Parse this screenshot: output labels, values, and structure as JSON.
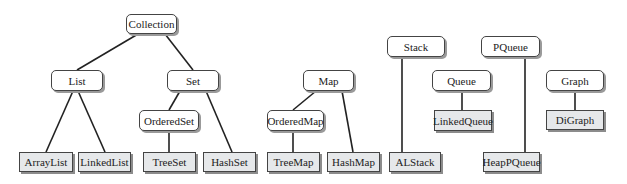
{
  "diagram": {
    "title": "",
    "colors": {
      "interface_fill": "#ffffff",
      "class_fill": "#e6e8ea",
      "edge": "#222222",
      "shadow": "#9a9a9a"
    },
    "nodes": [
      {
        "id": "collection",
        "label": "Collection",
        "kind": "interface",
        "x": 126,
        "y": 14,
        "w": 51,
        "h": 20
      },
      {
        "id": "list",
        "label": "List",
        "kind": "interface",
        "x": 51,
        "y": 70,
        "w": 52,
        "h": 21
      },
      {
        "id": "set",
        "label": "Set",
        "kind": "interface",
        "x": 167,
        "y": 70,
        "w": 52,
        "h": 21
      },
      {
        "id": "orderedset",
        "label": "OrderedSet",
        "kind": "interface",
        "x": 139,
        "y": 110,
        "w": 60,
        "h": 21
      },
      {
        "id": "arraylist",
        "label": "ArrayList",
        "kind": "class",
        "x": 19,
        "y": 152,
        "w": 54,
        "h": 20
      },
      {
        "id": "linkedlist",
        "label": "LinkedList",
        "kind": "class",
        "x": 78,
        "y": 152,
        "w": 53,
        "h": 20
      },
      {
        "id": "treeset",
        "label": "TreeSet",
        "kind": "class",
        "x": 143,
        "y": 152,
        "w": 53,
        "h": 20
      },
      {
        "id": "hashset",
        "label": "HashSet",
        "kind": "class",
        "x": 203,
        "y": 152,
        "w": 53,
        "h": 20
      },
      {
        "id": "map",
        "label": "Map",
        "kind": "interface",
        "x": 303,
        "y": 70,
        "w": 51,
        "h": 21
      },
      {
        "id": "orderedmap",
        "label": "OrderedMap",
        "kind": "interface",
        "x": 267,
        "y": 110,
        "w": 57,
        "h": 21
      },
      {
        "id": "treemap",
        "label": "TreeMap",
        "kind": "class",
        "x": 267,
        "y": 152,
        "w": 53,
        "h": 20
      },
      {
        "id": "hashmap",
        "label": "HashMap",
        "kind": "class",
        "x": 327,
        "y": 152,
        "w": 53,
        "h": 20
      },
      {
        "id": "stack",
        "label": "Stack",
        "kind": "interface",
        "x": 387,
        "y": 36,
        "w": 58,
        "h": 21
      },
      {
        "id": "alstack",
        "label": "ALStack",
        "kind": "class",
        "x": 389,
        "y": 152,
        "w": 52,
        "h": 20
      },
      {
        "id": "queue",
        "label": "Queue",
        "kind": "interface",
        "x": 432,
        "y": 70,
        "w": 59,
        "h": 21
      },
      {
        "id": "linkedqueue",
        "label": "LinkedQueue",
        "kind": "class",
        "x": 434,
        "y": 110,
        "w": 58,
        "h": 21
      },
      {
        "id": "pqueue",
        "label": "PQueue",
        "kind": "interface",
        "x": 481,
        "y": 36,
        "w": 59,
        "h": 21
      },
      {
        "id": "heappqueue",
        "label": "HeapPQueue",
        "kind": "class",
        "x": 483,
        "y": 152,
        "w": 57,
        "h": 20
      },
      {
        "id": "graph",
        "label": "Graph",
        "kind": "interface",
        "x": 546,
        "y": 70,
        "w": 58,
        "h": 21
      },
      {
        "id": "digraph",
        "label": "DiGraph",
        "kind": "class",
        "x": 546,
        "y": 110,
        "w": 58,
        "h": 20
      }
    ],
    "edges": [
      {
        "from": "collection",
        "to": "list",
        "x1": 138,
        "y1": 34,
        "x2": 77,
        "y2": 70
      },
      {
        "from": "collection",
        "to": "set",
        "x1": 165,
        "y1": 34,
        "x2": 193,
        "y2": 70
      },
      {
        "from": "list",
        "to": "arraylist",
        "x1": 73,
        "y1": 91,
        "x2": 46,
        "y2": 152
      },
      {
        "from": "list",
        "to": "linkedlist",
        "x1": 78,
        "y1": 91,
        "x2": 105,
        "y2": 152
      },
      {
        "from": "set",
        "to": "orderedset",
        "x1": 180,
        "y1": 91,
        "x2": 169,
        "y2": 110
      },
      {
        "from": "set",
        "to": "hashset",
        "x1": 206,
        "y1": 91,
        "x2": 232,
        "y2": 152
      },
      {
        "from": "orderedset",
        "to": "treeset",
        "x1": 169,
        "y1": 131,
        "x2": 169,
        "y2": 152
      },
      {
        "from": "map",
        "to": "orderedmap",
        "x1": 316,
        "y1": 91,
        "x2": 293,
        "y2": 110
      },
      {
        "from": "map",
        "to": "hashmap",
        "x1": 342,
        "y1": 91,
        "x2": 353,
        "y2": 152
      },
      {
        "from": "orderedmap",
        "to": "treemap",
        "x1": 293,
        "y1": 131,
        "x2": 293,
        "y2": 152
      },
      {
        "from": "stack",
        "to": "alstack",
        "x1": 402,
        "y1": 57,
        "x2": 402,
        "y2": 152
      },
      {
        "from": "queue",
        "to": "linkedqueue",
        "x1": 462,
        "y1": 91,
        "x2": 462,
        "y2": 110
      },
      {
        "from": "pqueue",
        "to": "heappqueue",
        "x1": 525,
        "y1": 57,
        "x2": 525,
        "y2": 152
      },
      {
        "from": "graph",
        "to": "digraph",
        "x1": 575,
        "y1": 91,
        "x2": 575,
        "y2": 110
      }
    ]
  }
}
